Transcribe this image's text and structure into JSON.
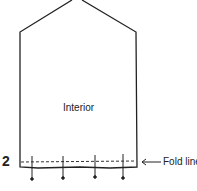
{
  "diagram": {
    "step_number": "2",
    "interior_label": "Interior",
    "fold_label": "Fold line",
    "pin_count": 4,
    "line_color": "#222222"
  }
}
